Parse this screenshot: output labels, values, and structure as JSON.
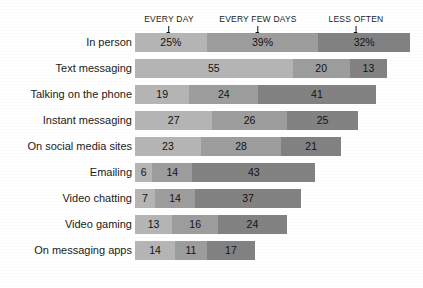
{
  "chart_data": {
    "type": "bar",
    "subtype": "stacked-horizontal",
    "title": "",
    "xlabel": "",
    "ylabel": "",
    "grid": false,
    "legend_position": "top",
    "xlim": [
      0,
      96
    ],
    "categories": [
      "In person",
      "Text messaging",
      "Talking on the phone",
      "Instant messaging",
      "On social media sites",
      "Emailing",
      "Video chatting",
      "Video gaming",
      "On messaging apps"
    ],
    "series": [
      {
        "name": "EVERY DAY",
        "color": "#b5b5b5",
        "values": [
          25,
          55,
          19,
          27,
          23,
          6,
          7,
          13,
          14
        ],
        "labels": [
          "25%",
          "55",
          "19",
          "27",
          "23",
          "6",
          "7",
          "13",
          "14"
        ]
      },
      {
        "name": "EVERY FEW DAYS",
        "color": "#9d9d9d",
        "values": [
          39,
          20,
          24,
          26,
          28,
          14,
          14,
          16,
          11
        ],
        "labels": [
          "39%",
          "20",
          "24",
          "26",
          "28",
          "14",
          "14",
          "16",
          "11"
        ]
      },
      {
        "name": "LESS OFTEN",
        "color": "#828282",
        "values": [
          32,
          13,
          41,
          25,
          21,
          43,
          37,
          24,
          17
        ],
        "labels": [
          "32%",
          "13",
          "41",
          "25",
          "21",
          "43",
          "37",
          "24",
          "17"
        ]
      }
    ],
    "totals": [
      96,
      88,
      84,
      78,
      72,
      63,
      58,
      53,
      42
    ]
  },
  "headers": [
    {
      "label": "EVERY DAY",
      "marker_x_pct": 12.5
    },
    {
      "label": "EVERY FEW DAYS",
      "marker_x_pct": 44.5
    },
    {
      "label": "LESS OFTEN",
      "marker_x_pct": 80.0
    }
  ],
  "colors": {
    "every_day": "#b5b5b5",
    "every_few_days": "#9d9d9d",
    "less_often": "#828282",
    "background": "#ffffff",
    "text": "#1a1a1a"
  }
}
